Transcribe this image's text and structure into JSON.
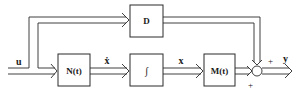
{
  "diagram": {
    "type": "state-space block diagram",
    "blocks": [
      {
        "id": "D",
        "label": "D"
      },
      {
        "id": "N",
        "label": "N(t)"
      },
      {
        "id": "integrator",
        "label": "∫"
      },
      {
        "id": "M",
        "label": "M(t)"
      }
    ],
    "signals": {
      "input": "u",
      "state_derivative": "ẋ",
      "state": "x",
      "output": "y"
    },
    "summing_junction": {
      "signs": [
        "+",
        "+"
      ]
    },
    "colors": {
      "line": "#2a2a2a",
      "background": "#ffffff"
    }
  }
}
